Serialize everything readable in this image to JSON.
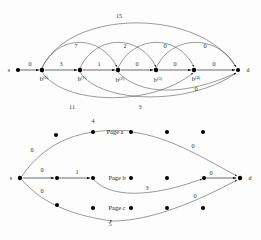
{
  "figure": {
    "background_color": "#fdfdfd",
    "edge_color": "#2b2b2b",
    "arc_color": "#4a4a4a",
    "node_color": "#000000"
  },
  "top_graph": {
    "name": "node-lattice-graph",
    "source_label": "s",
    "sink_label": "d",
    "nodes": [
      {
        "id": "b0",
        "base": "b",
        "superscript": "(0)",
        "cx": 42,
        "cy": 70
      },
      {
        "id": "b1",
        "base": "b",
        "superscript": "(1)",
        "cx": 80,
        "cy": 70
      },
      {
        "id": "b2",
        "base": "b",
        "superscript": "(2)",
        "cx": 118,
        "cy": 70
      },
      {
        "id": "b3",
        "base": "b",
        "superscript": "(3)",
        "cx": 156,
        "cy": 70
      },
      {
        "id": "b4",
        "base": "b",
        "superscript": "(4)",
        "cx": 194,
        "cy": 70
      }
    ],
    "terminals": [
      {
        "id": "s",
        "label": "s",
        "cx": 18,
        "cy": 70
      },
      {
        "id": "d",
        "label": "d",
        "cx": 238,
        "cy": 70
      }
    ],
    "spine_weights": [
      {
        "id": "w-s-b0",
        "value": "0",
        "x": 30,
        "y": 66
      },
      {
        "id": "w-b0-b1",
        "value": "3",
        "x": 61,
        "y": 66
      },
      {
        "id": "w-b1-b2",
        "value": "1",
        "x": 99,
        "y": 66
      },
      {
        "id": "w-b2-b3",
        "value": "0",
        "x": 137,
        "y": 66
      },
      {
        "id": "w-b3-b4",
        "value": "0",
        "x": 175,
        "y": 66
      },
      {
        "id": "w-b4-d",
        "value": "0",
        "x": 214,
        "y": 66
      }
    ],
    "upper_arc_weights": [
      {
        "id": "w-arc-top",
        "value": "15",
        "x": 119,
        "y": 18
      },
      {
        "id": "w-arc-u1",
        "value": "7",
        "x": 76,
        "y": 48
      },
      {
        "id": "w-arc-u2",
        "value": "2",
        "x": 125,
        "y": 48
      },
      {
        "id": "w-arc-u3",
        "value": "0",
        "x": 165,
        "y": 48
      },
      {
        "id": "w-arc-u4",
        "value": "0",
        "x": 205,
        "y": 48
      }
    ],
    "lower_arc_weights": [
      {
        "id": "w-arc-l1",
        "value": "0",
        "x": 196,
        "y": 91
      },
      {
        "id": "w-arc-l2",
        "value": "11",
        "x": 72,
        "y": 109
      },
      {
        "id": "w-arc-l3",
        "value": "3",
        "x": 140,
        "y": 109
      }
    ]
  },
  "bottom_graph": {
    "name": "page-routing-graph",
    "source_label": "s",
    "sink_label": "d",
    "rows": [
      {
        "id": "row-a",
        "label": "Page a",
        "y": 132,
        "label_x": 115
      },
      {
        "id": "row-b",
        "label": "Page b",
        "y": 175,
        "label_x": 117
      },
      {
        "id": "row-c",
        "label": "Page c",
        "y": 208,
        "label_x": 117
      }
    ],
    "terminals": [
      {
        "id": "s",
        "label": "s",
        "cx": 20,
        "cy": 178
      },
      {
        "id": "d",
        "label": "d",
        "cx": 240,
        "cy": 178
      }
    ],
    "dots": [
      {
        "id": "a-1",
        "cx": 56,
        "cy": 135
      },
      {
        "id": "a-2",
        "cx": 93,
        "cy": 132
      },
      {
        "id": "a-3",
        "cx": 131,
        "cy": 132
      },
      {
        "id": "a-4",
        "cx": 167,
        "cy": 132
      },
      {
        "id": "a-5",
        "cx": 203,
        "cy": 132
      },
      {
        "id": "b-1",
        "cx": 57,
        "cy": 178
      },
      {
        "id": "b-2",
        "cx": 93,
        "cy": 178
      },
      {
        "id": "b-3",
        "cx": 131,
        "cy": 178
      },
      {
        "id": "b-4",
        "cx": 167,
        "cy": 178
      },
      {
        "id": "b-5",
        "cx": 204,
        "cy": 178
      },
      {
        "id": "c-1",
        "cx": 57,
        "cy": 205
      },
      {
        "id": "c-2",
        "cx": 93,
        "cy": 208
      },
      {
        "id": "c-3",
        "cx": 131,
        "cy": 208
      },
      {
        "id": "c-4",
        "cx": 167,
        "cy": 208
      },
      {
        "id": "c-5",
        "cx": 203,
        "cy": 208
      }
    ],
    "weights": [
      {
        "id": "bw-s-a",
        "value": "0",
        "x": 32,
        "y": 152
      },
      {
        "id": "bw-s-b",
        "value": "0",
        "x": 42,
        "y": 172
      },
      {
        "id": "bw-s-c",
        "value": "0",
        "x": 42,
        "y": 193
      },
      {
        "id": "bw-a-top",
        "value": "4",
        "x": 93,
        "y": 123
      },
      {
        "id": "bw-b-mid",
        "value": "1",
        "x": 77,
        "y": 174
      },
      {
        "id": "bw-a-d",
        "value": "0",
        "x": 193,
        "y": 148
      },
      {
        "id": "bw-b-d",
        "value": "0",
        "x": 211,
        "y": 175
      },
      {
        "id": "bw-b-low",
        "value": "3",
        "x": 147,
        "y": 190
      },
      {
        "id": "bw-c-d",
        "value": "0",
        "x": 195,
        "y": 198
      },
      {
        "id": "bw-c-low",
        "value": "5",
        "x": 110,
        "y": 226
      }
    ]
  }
}
